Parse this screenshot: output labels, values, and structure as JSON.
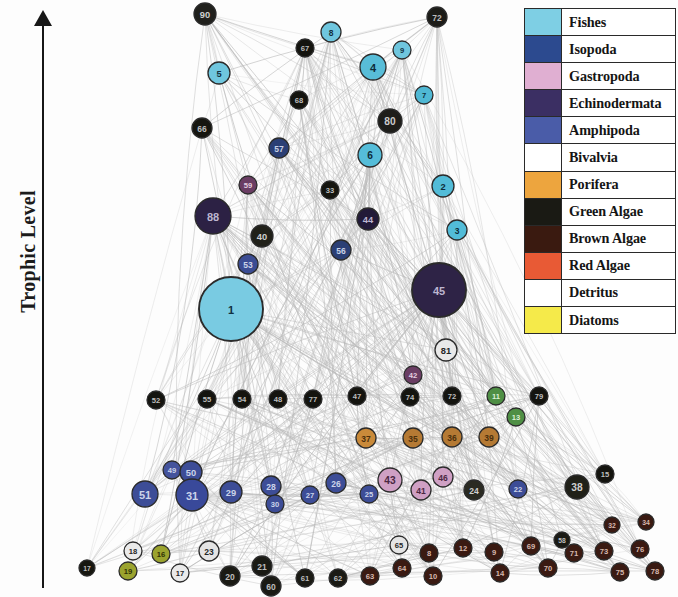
{
  "axis": {
    "label": "Trophic Level",
    "arrow_direction": "up"
  },
  "legend": {
    "items": [
      {
        "label": "Fishes",
        "color": "#7ecfe4"
      },
      {
        "label": "Isopoda",
        "color": "#2c4a8f"
      },
      {
        "label": "Gastropoda",
        "color": "#e0afd2"
      },
      {
        "label": "Echinodermata",
        "color": "#3b2f63"
      },
      {
        "label": "Amphipoda",
        "color": "#4a5ca8"
      },
      {
        "label": "Bivalvia",
        "color": "#8cc濃"
      },
      {
        "label": "Porifera",
        "color": "#eda53e"
      },
      {
        "label": "Green Algae",
        "color": "#1a1a14"
      },
      {
        "label": "Brown Algae",
        "color": "#3a1a10"
      },
      {
        "label": "Red Algae",
        "color": "#e85a35"
      },
      {
        "label": "Detritus",
        "color": "#ffffff"
      },
      {
        "label": "Diatoms",
        "color": "#f5ea4a"
      }
    ]
  },
  "chart_data": {
    "type": "network",
    "title": "",
    "ylabel": "Trophic Level",
    "edge_color": "#b9b9b9",
    "node_stroke": "#2b2b2b",
    "groups": [
      "Fishes",
      "Isopoda",
      "Gastropoda",
      "Echinodermata",
      "Amphipoda",
      "Bivalvia",
      "Porifera",
      "Green Algae",
      "Brown Algae",
      "Red Algae",
      "Detritus",
      "Diatoms"
    ],
    "nodes": [
      {
        "id": "90",
        "x": 205,
        "y": 14,
        "r": 11,
        "group": "Green Algae",
        "color": "#20201c",
        "label_color": "#cfcfcf"
      },
      {
        "id": "8",
        "x": 331,
        "y": 32,
        "r": 10,
        "group": "Fishes",
        "color": "#6fc6de",
        "label_color": "#123040"
      },
      {
        "id": "72",
        "x": 437,
        "y": 17,
        "r": 10,
        "group": "Green Algae",
        "color": "#1c1c18",
        "label_color": "#bdbdbd"
      },
      {
        "id": "5",
        "x": 219,
        "y": 73,
        "r": 11,
        "group": "Fishes",
        "color": "#6fc6de",
        "label_color": "#123040"
      },
      {
        "id": "4",
        "x": 373,
        "y": 67,
        "r": 13,
        "group": "Fishes",
        "color": "#58bdd8",
        "label_color": "#0e2c3a"
      },
      {
        "id": "9",
        "x": 402,
        "y": 50,
        "r": 9,
        "group": "Fishes",
        "color": "#6fc6de",
        "label_color": "#123040"
      },
      {
        "id": "67",
        "x": 305,
        "y": 48,
        "r": 9,
        "group": "Green Algae",
        "color": "#14140f",
        "label_color": "#bdbdbd"
      },
      {
        "id": "7",
        "x": 424,
        "y": 95,
        "r": 9,
        "group": "Fishes",
        "color": "#4fb8d4",
        "label_color": "#0e2c3a"
      },
      {
        "id": "80",
        "x": 390,
        "y": 121,
        "r": 12,
        "group": "Green Algae",
        "color": "#1e1e1a",
        "label_color": "#cccccc"
      },
      {
        "id": "68",
        "x": 299,
        "y": 100,
        "r": 9,
        "group": "Green Algae",
        "color": "#14140f",
        "label_color": "#bdbdbd"
      },
      {
        "id": "66",
        "x": 202,
        "y": 128,
        "r": 10,
        "group": "Green Algae",
        "color": "#15150f",
        "label_color": "#bdbdbd"
      },
      {
        "id": "6",
        "x": 370,
        "y": 155,
        "r": 12,
        "group": "Fishes",
        "color": "#55bdd9",
        "label_color": "#0e2c3a"
      },
      {
        "id": "57",
        "x": 279,
        "y": 148,
        "r": 10,
        "group": "Isopoda",
        "color": "#2b3f75",
        "label_color": "#c9d2e8"
      },
      {
        "id": "59",
        "x": 248,
        "y": 185,
        "r": 9,
        "group": "Gastropoda",
        "color": "#6a3d63",
        "label_color": "#e4cfe0"
      },
      {
        "id": "33",
        "x": 330,
        "y": 190,
        "r": 9,
        "group": "Green Algae",
        "color": "#15150f",
        "label_color": "#bdbdbd"
      },
      {
        "id": "2",
        "x": 443,
        "y": 186,
        "r": 11,
        "group": "Fishes",
        "color": "#52bcd8",
        "label_color": "#0e2c3a"
      },
      {
        "id": "88",
        "x": 213,
        "y": 216,
        "r": 18,
        "group": "Echinodermata",
        "color": "#2c2144",
        "label_color": "#bdb6d0"
      },
      {
        "id": "40",
        "x": 262,
        "y": 236,
        "r": 11,
        "group": "Green Algae",
        "color": "#212119",
        "label_color": "#cfcfcf"
      },
      {
        "id": "44",
        "x": 368,
        "y": 219,
        "r": 11,
        "group": "Echinodermata",
        "color": "#221a38",
        "label_color": "#bdb6d0"
      },
      {
        "id": "3",
        "x": 457,
        "y": 230,
        "r": 10,
        "group": "Fishes",
        "color": "#52bcd8",
        "label_color": "#0e2c3a"
      },
      {
        "id": "53",
        "x": 248,
        "y": 264,
        "r": 10,
        "group": "Amphipoda",
        "color": "#3b4c93",
        "label_color": "#ccd4ea"
      },
      {
        "id": "56",
        "x": 341,
        "y": 250,
        "r": 10,
        "group": "Isopoda",
        "color": "#2b3f75",
        "label_color": "#c9d2e8"
      },
      {
        "id": "1",
        "x": 231,
        "y": 309,
        "r": 32,
        "group": "Fishes",
        "color": "#79cbe2",
        "label_color": "#123040"
      },
      {
        "id": "45",
        "x": 439,
        "y": 290,
        "r": 27,
        "group": "Echinodermata",
        "color": "#2e2346",
        "label_color": "#bdb6d0"
      },
      {
        "id": "81",
        "x": 446,
        "y": 350,
        "r": 11,
        "group": "Detritus",
        "color": "#e9e9e9",
        "label_color": "#262626"
      },
      {
        "id": "52",
        "x": 156,
        "y": 400,
        "r": 9,
        "group": "Green Algae",
        "color": "#14140f",
        "label_color": "#bdbdbd"
      },
      {
        "id": "55",
        "x": 207,
        "y": 399,
        "r": 9,
        "group": "Green Algae",
        "color": "#14140f",
        "label_color": "#bdbdbd"
      },
      {
        "id": "54",
        "x": 242,
        "y": 399,
        "r": 9,
        "group": "Green Algae",
        "color": "#14140f",
        "label_color": "#bdbdbd"
      },
      {
        "id": "48",
        "x": 278,
        "y": 399,
        "r": 9,
        "group": "Green Algae",
        "color": "#14140f",
        "label_color": "#bdbdbd"
      },
      {
        "id": "77",
        "x": 313,
        "y": 399,
        "r": 9,
        "group": "Green Algae",
        "color": "#14140f",
        "label_color": "#bdbdbd"
      },
      {
        "id": "47",
        "x": 357,
        "y": 396,
        "r": 9,
        "group": "Green Algae",
        "color": "#14140f",
        "label_color": "#bdbdbd"
      },
      {
        "id": "42",
        "x": 413,
        "y": 375,
        "r": 9,
        "group": "Gastropoda",
        "color": "#6a3d63",
        "label_color": "#e4cfe0"
      },
      {
        "id": "74",
        "x": 410,
        "y": 397,
        "r": 9,
        "group": "Green Algae",
        "color": "#14140f",
        "label_color": "#bdbdbd"
      },
      {
        "id": "72b",
        "x": 452,
        "y": 396,
        "r": 9,
        "group": "Green Algae",
        "color": "#14140f",
        "label_color": "#bdbdbd"
      },
      {
        "id": "11",
        "x": 496,
        "y": 396,
        "r": 9,
        "group": "Bivalvia",
        "color": "#4f8f45",
        "label_color": "#dcefd6"
      },
      {
        "id": "79",
        "x": 539,
        "y": 396,
        "r": 9,
        "group": "Green Algae",
        "color": "#14140f",
        "label_color": "#bdbdbd"
      },
      {
        "id": "13",
        "x": 516,
        "y": 417,
        "r": 9,
        "group": "Bivalvia",
        "color": "#4f8f45",
        "label_color": "#dcefd6"
      },
      {
        "id": "37",
        "x": 366,
        "y": 438,
        "r": 10,
        "group": "Porifera",
        "color": "#c98a3a",
        "label_color": "#4a2f0c"
      },
      {
        "id": "35",
        "x": 413,
        "y": 438,
        "r": 10,
        "group": "Porifera",
        "color": "#b57a34",
        "label_color": "#4a2f0c"
      },
      {
        "id": "36",
        "x": 452,
        "y": 437,
        "r": 10,
        "group": "Porifera",
        "color": "#b57a34",
        "label_color": "#4a2f0c"
      },
      {
        "id": "39",
        "x": 489,
        "y": 437,
        "r": 10,
        "group": "Porifera",
        "color": "#b57a34",
        "label_color": "#4a2f0c"
      },
      {
        "id": "49",
        "x": 172,
        "y": 470,
        "r": 9,
        "group": "Amphipoda",
        "color": "#44539c",
        "label_color": "#ccd4ea"
      },
      {
        "id": "51",
        "x": 145,
        "y": 494,
        "r": 13,
        "group": "Amphipoda",
        "color": "#3d4d97",
        "label_color": "#ccd4ea"
      },
      {
        "id": "50",
        "x": 191,
        "y": 472,
        "r": 11,
        "group": "Amphipoda",
        "color": "#3d4d97",
        "label_color": "#ccd4ea"
      },
      {
        "id": "31",
        "x": 192,
        "y": 495,
        "r": 16,
        "group": "Amphipoda",
        "color": "#39499a",
        "label_color": "#ccd4ea"
      },
      {
        "id": "29",
        "x": 231,
        "y": 492,
        "r": 11,
        "group": "Amphipoda",
        "color": "#3d4d97",
        "label_color": "#ccd4ea"
      },
      {
        "id": "28",
        "x": 271,
        "y": 486,
        "r": 10,
        "group": "Amphipoda",
        "color": "#3d4d97",
        "label_color": "#ccd4ea"
      },
      {
        "id": "30",
        "x": 275,
        "y": 504,
        "r": 9,
        "group": "Amphipoda",
        "color": "#3d4d97",
        "label_color": "#ccd4ea"
      },
      {
        "id": "27",
        "x": 310,
        "y": 495,
        "r": 9,
        "group": "Amphipoda",
        "color": "#3d4d97",
        "label_color": "#ccd4ea"
      },
      {
        "id": "26",
        "x": 336,
        "y": 483,
        "r": 10,
        "group": "Amphipoda",
        "color": "#3d4d97",
        "label_color": "#ccd4ea"
      },
      {
        "id": "25",
        "x": 369,
        "y": 494,
        "r": 9,
        "group": "Amphipoda",
        "color": "#3d4d97",
        "label_color": "#ccd4ea"
      },
      {
        "id": "43",
        "x": 390,
        "y": 480,
        "r": 12,
        "group": "Gastropoda",
        "color": "#cfa0c4",
        "label_color": "#4a2742"
      },
      {
        "id": "41",
        "x": 421,
        "y": 490,
        "r": 10,
        "group": "Gastropoda",
        "color": "#cfa0c4",
        "label_color": "#4a2742"
      },
      {
        "id": "46",
        "x": 443,
        "y": 477,
        "r": 10,
        "group": "Gastropoda",
        "color": "#cfa0c4",
        "label_color": "#4a2742"
      },
      {
        "id": "24",
        "x": 474,
        "y": 490,
        "r": 10,
        "group": "Green Algae",
        "color": "#2a2a22",
        "label_color": "#cfcfcf"
      },
      {
        "id": "22",
        "x": 518,
        "y": 489,
        "r": 9,
        "group": "Amphipoda",
        "color": "#3d4d97",
        "label_color": "#ccd4ea"
      },
      {
        "id": "38",
        "x": 577,
        "y": 487,
        "r": 12,
        "group": "Green Algae",
        "color": "#202018",
        "label_color": "#cfcfcf"
      },
      {
        "id": "15",
        "x": 605,
        "y": 474,
        "r": 9,
        "group": "Green Algae",
        "color": "#14140f",
        "label_color": "#bdbdbd"
      },
      {
        "id": "17",
        "x": 87,
        "y": 568,
        "r": 8,
        "group": "Green Algae",
        "color": "#161610",
        "label_color": "#bdbdbd"
      },
      {
        "id": "19",
        "x": 128,
        "y": 571,
        "r": 9,
        "group": "Diatoms",
        "color": "#9ba32e",
        "label_color": "#2f3205"
      },
      {
        "id": "18",
        "x": 133,
        "y": 551,
        "r": 9,
        "group": "Detritus",
        "color": "#eaeaea",
        "label_color": "#262626"
      },
      {
        "id": "16",
        "x": 161,
        "y": 554,
        "r": 9,
        "group": "Diatoms",
        "color": "#9ba32e",
        "label_color": "#2f3205"
      },
      {
        "id": "17b",
        "x": 180,
        "y": 573,
        "r": 9,
        "group": "Detritus",
        "color": "#eaeaea",
        "label_color": "#262626"
      },
      {
        "id": "23",
        "x": 209,
        "y": 551,
        "r": 10,
        "group": "Detritus",
        "color": "#e4e4e4",
        "label_color": "#262626"
      },
      {
        "id": "20",
        "x": 230,
        "y": 576,
        "r": 10,
        "group": "Green Algae",
        "color": "#1a1a14",
        "label_color": "#bdbdbd"
      },
      {
        "id": "21",
        "x": 262,
        "y": 566,
        "r": 10,
        "group": "Green Algae",
        "color": "#1a1a14",
        "label_color": "#bdbdbd"
      },
      {
        "id": "60",
        "x": 271,
        "y": 586,
        "r": 10,
        "group": "Green Algae",
        "color": "#1a1a14",
        "label_color": "#bdbdbd"
      },
      {
        "id": "61",
        "x": 305,
        "y": 578,
        "r": 9,
        "group": "Green Algae",
        "color": "#1a1a14",
        "label_color": "#bdbdbd"
      },
      {
        "id": "62",
        "x": 338,
        "y": 578,
        "r": 9,
        "group": "Green Algae",
        "color": "#1a1a14",
        "label_color": "#bdbdbd"
      },
      {
        "id": "63",
        "x": 370,
        "y": 576,
        "r": 9,
        "group": "Brown Algae",
        "color": "#3a1a12",
        "label_color": "#d6b8ae"
      },
      {
        "id": "65",
        "x": 399,
        "y": 545,
        "r": 9,
        "group": "Detritus",
        "color": "#e4e4e4",
        "label_color": "#262626"
      },
      {
        "id": "64",
        "x": 402,
        "y": 568,
        "r": 9,
        "group": "Brown Algae",
        "color": "#3a1a12",
        "label_color": "#d6b8ae"
      },
      {
        "id": "8b",
        "x": 429,
        "y": 553,
        "r": 9,
        "group": "Brown Algae",
        "color": "#3a1a12",
        "label_color": "#d6b8ae"
      },
      {
        "id": "10",
        "x": 433,
        "y": 576,
        "r": 9,
        "group": "Brown Algae",
        "color": "#3a1a12",
        "label_color": "#d6b8ae"
      },
      {
        "id": "12",
        "x": 463,
        "y": 548,
        "r": 9,
        "group": "Brown Algae",
        "color": "#3a1a12",
        "label_color": "#d6b8ae"
      },
      {
        "id": "9b",
        "x": 494,
        "y": 552,
        "r": 9,
        "group": "Brown Algae",
        "color": "#3a1a12",
        "label_color": "#d6b8ae"
      },
      {
        "id": "14",
        "x": 500,
        "y": 573,
        "r": 9,
        "group": "Brown Algae",
        "color": "#3a1a12",
        "label_color": "#d6b8ae"
      },
      {
        "id": "69",
        "x": 531,
        "y": 546,
        "r": 9,
        "group": "Brown Algae",
        "color": "#3a1a12",
        "label_color": "#d6b8ae"
      },
      {
        "id": "70",
        "x": 548,
        "y": 568,
        "r": 9,
        "group": "Brown Algae",
        "color": "#3a1a12",
        "label_color": "#d6b8ae"
      },
      {
        "id": "71",
        "x": 574,
        "y": 553,
        "r": 9,
        "group": "Brown Algae",
        "color": "#3a1a12",
        "label_color": "#d6b8ae"
      },
      {
        "id": "73",
        "x": 604,
        "y": 551,
        "r": 9,
        "group": "Brown Algae",
        "color": "#3a1a12",
        "label_color": "#d6b8ae"
      },
      {
        "id": "75",
        "x": 620,
        "y": 572,
        "r": 9,
        "group": "Brown Algae",
        "color": "#3a1a12",
        "label_color": "#d6b8ae"
      },
      {
        "id": "76",
        "x": 640,
        "y": 549,
        "r": 9,
        "group": "Brown Algae",
        "color": "#3a1a12",
        "label_color": "#d6b8ae"
      },
      {
        "id": "78",
        "x": 655,
        "y": 571,
        "r": 9,
        "group": "Brown Algae",
        "color": "#3a1a12",
        "label_color": "#d6b8ae"
      },
      {
        "id": "58",
        "x": 562,
        "y": 540,
        "r": 8,
        "group": "Green Algae",
        "color": "#1a1a14",
        "label_color": "#bdbdbd"
      },
      {
        "id": "32",
        "x": 612,
        "y": 525,
        "r": 8,
        "group": "Brown Algae",
        "color": "#3a1a12",
        "label_color": "#d6b8ae"
      },
      {
        "id": "34",
        "x": 646,
        "y": 522,
        "r": 8,
        "group": "Brown Algae",
        "color": "#3a1a12",
        "label_color": "#d6b8ae"
      }
    ]
  }
}
